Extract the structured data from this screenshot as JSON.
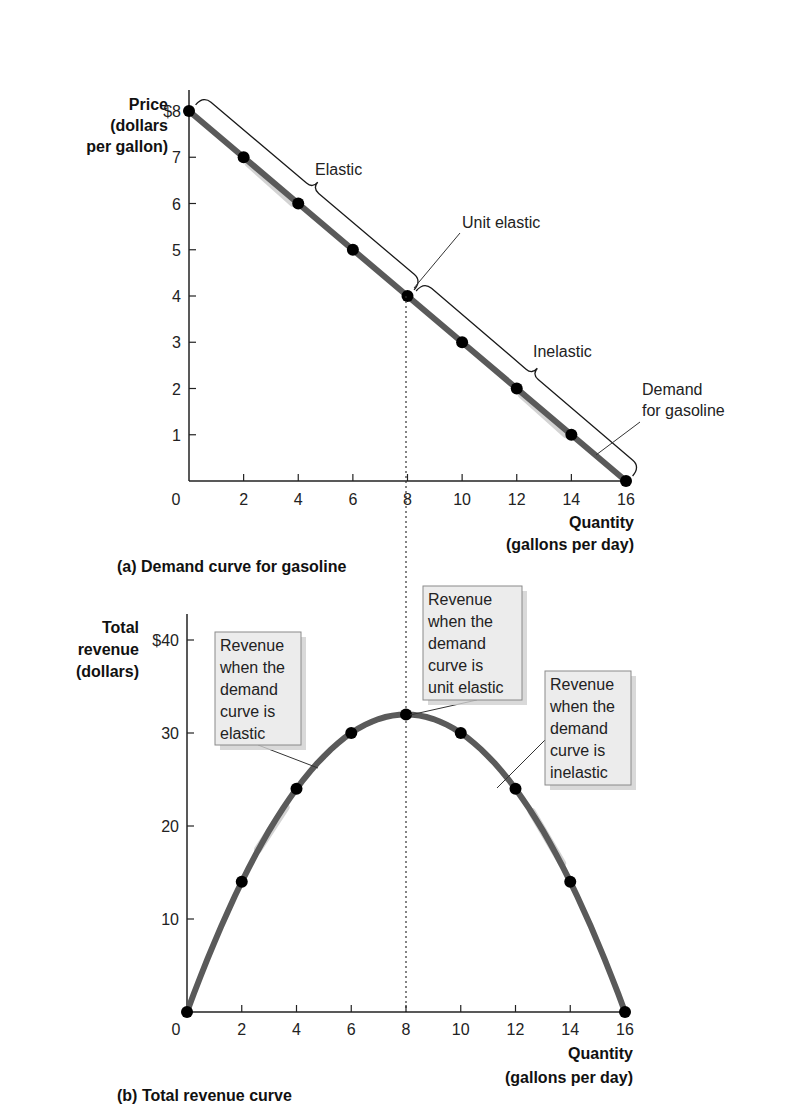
{
  "chart_data": [
    {
      "panel": "a",
      "type": "line",
      "title": "(a) Demand curve for gasoline",
      "xlabel": [
        "Quantity",
        "(gallons per day)"
      ],
      "ylabel": [
        "Price",
        "(dollars",
        "per gallon)"
      ],
      "x_ticks": [
        "0",
        "2",
        "4",
        "6",
        "8",
        "10",
        "12",
        "14",
        "16"
      ],
      "y_ticks": [
        "$8",
        "7",
        "6",
        "5",
        "4",
        "3",
        "2",
        "1"
      ],
      "xlim": [
        0,
        16
      ],
      "ylim": [
        0,
        8
      ],
      "grid": false,
      "series": [
        {
          "name": "Demand for gasoline",
          "x": [
            0,
            2,
            4,
            6,
            8,
            10,
            12,
            14,
            16
          ],
          "y": [
            8,
            7,
            6,
            5,
            4,
            3,
            2,
            1,
            0
          ]
        }
      ],
      "annotations": [
        {
          "label": "Elastic",
          "range_x": [
            0,
            8
          ]
        },
        {
          "label": "Unit elastic",
          "x": 8,
          "y": 4
        },
        {
          "label": "Inelastic",
          "range_x": [
            8,
            16
          ]
        },
        {
          "label": "Demand for gasoline",
          "lines": [
            "Demand",
            "for gasoline"
          ]
        }
      ]
    },
    {
      "panel": "b",
      "type": "line",
      "title": "(b) Total revenue curve",
      "xlabel": [
        "Quantity",
        "(gallons per day)"
      ],
      "ylabel": [
        "Total",
        "revenue",
        "(dollars)"
      ],
      "x_ticks": [
        "0",
        "2",
        "4",
        "6",
        "8",
        "10",
        "12",
        "14",
        "16"
      ],
      "y_ticks": [
        "$40",
        "30",
        "20",
        "10"
      ],
      "xlim": [
        0,
        16
      ],
      "ylim": [
        0,
        40
      ],
      "grid": false,
      "series": [
        {
          "name": "Total revenue",
          "x": [
            0,
            2,
            4,
            6,
            8,
            10,
            12,
            14,
            16
          ],
          "y": [
            0,
            14,
            24,
            30,
            32,
            30,
            24,
            14,
            0
          ]
        }
      ],
      "annotations": [
        {
          "label": "Revenue when the demand curve is elastic",
          "lines": [
            "Revenue",
            "when the",
            "demand",
            "curve is",
            "elastic"
          ]
        },
        {
          "label": "Revenue when the demand curve is unit elastic",
          "lines": [
            "Revenue",
            "when the",
            "demand",
            "curve is",
            "unit elastic"
          ]
        },
        {
          "label": "Revenue when the demand curve is inelastic",
          "lines": [
            "Revenue",
            "when the",
            "demand",
            "curve is",
            "inelastic"
          ]
        }
      ]
    }
  ],
  "colors": {
    "curve": "#5a5a5a",
    "curve_glow": "#c9c9c9",
    "point": "#000000",
    "axis": "#222222",
    "box_fill": "#ececec",
    "box_border": "#8a8a8a",
    "box_shadow": "#d0d0d0"
  }
}
